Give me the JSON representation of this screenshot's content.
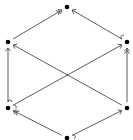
{
  "diagram": {
    "type": "commutative-diagram",
    "background": "#ffffff",
    "stroke_color": "#333333",
    "node_color": "#000000",
    "nodes": [
      {
        "id": "top",
        "x": 67,
        "y": 7
      },
      {
        "id": "upper-left",
        "x": 8,
        "y": 42
      },
      {
        "id": "upper-right",
        "x": 127,
        "y": 42
      },
      {
        "id": "lower-left",
        "x": 8,
        "y": 108
      },
      {
        "id": "lower-right",
        "x": 127,
        "y": 108
      },
      {
        "id": "bottom",
        "x": 67,
        "y": 138
      }
    ],
    "edges": [
      {
        "from": "upper-left",
        "to": "top",
        "style": "epi"
      },
      {
        "from": "upper-right",
        "to": "top",
        "style": "mono"
      },
      {
        "from": "lower-left",
        "to": "upper-left",
        "style": "mono"
      },
      {
        "from": "lower-left",
        "to": "upper-right",
        "style": "mono"
      },
      {
        "from": "lower-right",
        "to": "upper-left",
        "style": "plain"
      },
      {
        "from": "lower-right",
        "to": "upper-right",
        "style": "epi"
      },
      {
        "from": "bottom",
        "to": "lower-left",
        "style": "epi"
      },
      {
        "from": "bottom",
        "to": "lower-right",
        "style": "mono"
      }
    ]
  }
}
